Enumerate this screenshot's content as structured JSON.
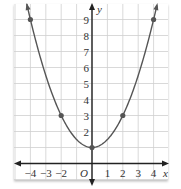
{
  "chart_data": {
    "type": "line",
    "title": "",
    "xlabel": "x",
    "ylabel": "y",
    "origin_label": "O",
    "xlim": [
      -5,
      5
    ],
    "ylim": [
      -1,
      10
    ],
    "grid": true,
    "x_ticks": [
      -4,
      -3,
      -2,
      1,
      2,
      3,
      4
    ],
    "x_tick_labels": [
      "−4",
      "−3",
      "−2",
      "1",
      "2",
      "3",
      "4"
    ],
    "y_ticks": [
      2,
      3,
      4,
      5,
      6,
      7,
      8,
      9
    ],
    "y_tick_labels": [
      "2",
      "3",
      "4",
      "5",
      "6",
      "7",
      "8",
      "9"
    ],
    "series": [
      {
        "name": "parabola",
        "equation": "y = x^2/2 + 1",
        "color": "#555555",
        "marked_points": [
          [
            -4,
            9
          ],
          [
            -2,
            3
          ],
          [
            0,
            1
          ],
          [
            2,
            3
          ],
          [
            4,
            9
          ]
        ]
      }
    ]
  },
  "colors": {
    "grid": "#cfcfcf",
    "axis": "#222222",
    "curve": "#555555",
    "point": "#555555"
  }
}
